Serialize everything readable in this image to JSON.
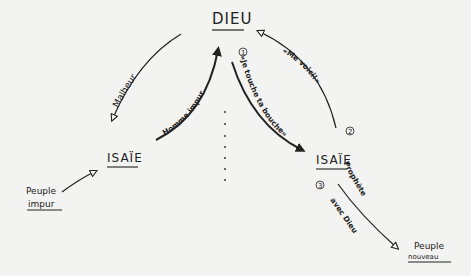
{
  "diagram": {
    "nodes": {
      "dieu": "DIEU",
      "isaie_left": "ISAÏE",
      "isaie_right": "ISAÏE",
      "peuple_impur_line1": "Peuple",
      "peuple_impur_line2": "impur",
      "peuple_nouveau_line1": "Peuple",
      "peuple_nouveau_line2": "nouveau"
    },
    "edges": {
      "malheur": "Malheur",
      "homme_impur": "Homme impur",
      "te_touche": "«Je touche ta bouche»",
      "me_voici": "«Me voici!»",
      "prophete_line1": "Prophète",
      "prophete_line2": "avec Dieu"
    },
    "step_numbers": {
      "one": "1",
      "two": "2",
      "three": "3"
    },
    "colors": {
      "ink": "#222222",
      "paper": "#f3f3f1"
    }
  }
}
